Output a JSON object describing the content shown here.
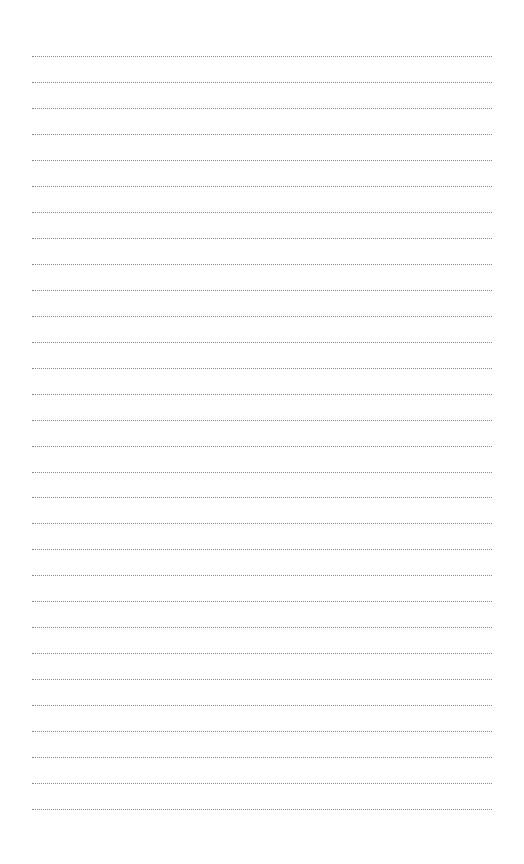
{
  "page": {
    "type": "lined-notepaper",
    "line_style": "dotted",
    "line_color": "#8a8a8a",
    "background": "#ffffff",
    "line_count": 30,
    "first_line_y": 56,
    "line_spacing": 25.97,
    "line_left": 32,
    "line_width": 460
  }
}
